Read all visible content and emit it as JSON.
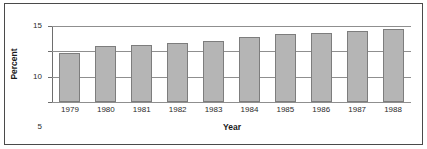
{
  "chart_data": {
    "type": "bar",
    "title": "",
    "subtitle": "",
    "xlabel": "Year",
    "ylabel": "Percent",
    "categories": [
      "1979",
      "1980",
      "1981",
      "1982",
      "1983",
      "1984",
      "1985",
      "1986",
      "1987",
      "1988"
    ],
    "values": [
      9.6,
      11.0,
      11.2,
      11.6,
      12.1,
      12.9,
      13.4,
      13.6,
      14.1,
      14.4
    ],
    "series": [
      {
        "name": "Percent",
        "values": [
          9.6,
          11.0,
          11.2,
          11.6,
          12.1,
          12.9,
          13.4,
          13.6,
          14.1,
          14.4
        ]
      }
    ],
    "ylim": [
      0,
      15
    ],
    "yticks": [
      0,
      5,
      10,
      15
    ],
    "ytick_labels": [
      "0",
      "5",
      "10",
      "15"
    ],
    "grid": "horizontal",
    "legend": "none",
    "bar_color": "#b5b5b5",
    "bar_border_color": "#7d7d7d",
    "gridline_color": "#8f8f8f",
    "axis_color": "#6e6e6e",
    "frame_color": "#4a4a4a",
    "background": "#ffffff"
  }
}
